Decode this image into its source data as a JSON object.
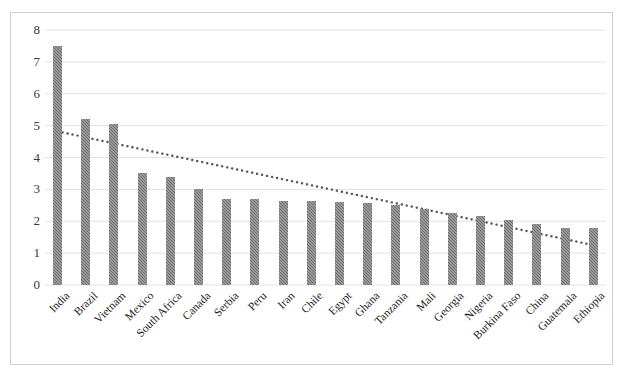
{
  "chart_data": {
    "type": "bar",
    "title": "",
    "subtitle": "",
    "xlabel": "",
    "ylabel": "",
    "categories": [
      "India",
      "Brazil",
      "Vietnam",
      "Mexico",
      "South Africa",
      "Canada",
      "Serbia",
      "Peru",
      "Iran",
      "Chile",
      "Egypt",
      "Ghana",
      "Tanzania",
      "Mali",
      "Georgia",
      "Nigeria",
      "Burkina Faso",
      "China",
      "Guatemala",
      "Ethiopia"
    ],
    "values": [
      7.5,
      5.2,
      5.05,
      3.5,
      3.4,
      3.0,
      2.7,
      2.7,
      2.65,
      2.62,
      2.6,
      2.58,
      2.5,
      2.4,
      2.25,
      2.15,
      2.05,
      1.9,
      1.78,
      1.8
    ],
    "series": [
      {
        "name": "Value",
        "type": "bar",
        "values": [
          7.5,
          5.2,
          5.05,
          3.5,
          3.4,
          3.0,
          2.7,
          2.7,
          2.65,
          2.62,
          2.6,
          2.58,
          2.5,
          2.4,
          2.25,
          2.15,
          2.05,
          1.9,
          1.78,
          1.8
        ]
      },
      {
        "name": "Trendline",
        "type": "line",
        "style": "dotted",
        "start_value": 4.82,
        "end_value": 1.25,
        "values": [
          4.82,
          4.63,
          4.44,
          4.25,
          4.07,
          3.88,
          3.69,
          3.5,
          3.31,
          3.13,
          2.94,
          2.75,
          2.56,
          2.38,
          2.19,
          2.0,
          1.81,
          1.62,
          1.44,
          1.25
        ]
      }
    ],
    "ylim": [
      0,
      8
    ],
    "yticks": [
      0,
      1,
      2,
      3,
      4,
      5,
      6,
      7,
      8
    ],
    "ytick_labels": [
      "0",
      "1",
      "2",
      "3",
      "4",
      "5",
      "6",
      "7",
      "8"
    ],
    "grid": true,
    "grid_axis": "y",
    "legend": false,
    "legend_position": "none",
    "xtick_rotation": -45,
    "colors": {
      "bar": "#6e6e6e",
      "trendline": "#595959",
      "gridline": "#e3e3e3",
      "frame_border": "#d0d0d0",
      "axis_text": "#3a3a3a",
      "category_text": "#1c1c1c",
      "background": "#ffffff"
    }
  }
}
